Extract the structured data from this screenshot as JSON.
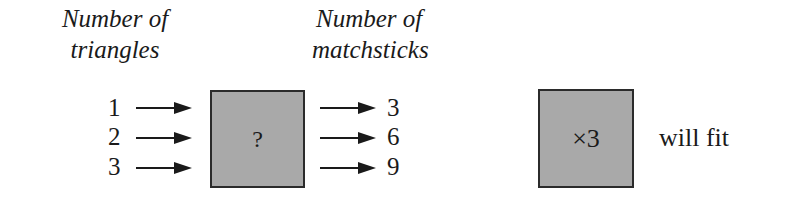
{
  "headings": {
    "input": [
      "Number of",
      "triangles"
    ],
    "output": [
      "Number of",
      "matchsticks"
    ]
  },
  "inputs": [
    "1",
    "2",
    "3"
  ],
  "outputs": [
    "3",
    "6",
    "9"
  ],
  "function_box": {
    "label": "?"
  },
  "answer_box": {
    "label": "×3"
  },
  "answer_text": "will fit",
  "colors": {
    "box_fill": "#a9a9a9",
    "ink": "#1a1a1a"
  }
}
